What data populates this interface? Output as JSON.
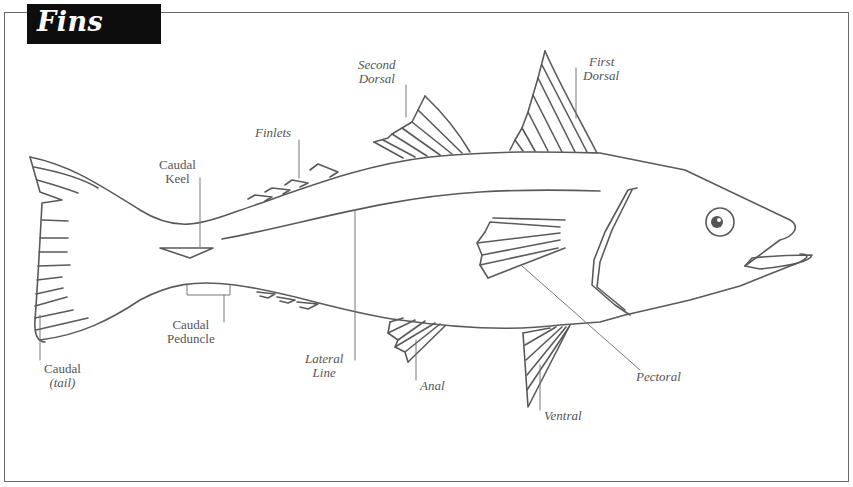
{
  "title": "Fins",
  "colors": {
    "title_bg": "#0d0d0d",
    "title_fg": "#ffffff",
    "line": "#5a5a5a",
    "label": "#555555"
  },
  "labels": {
    "second_dorsal": {
      "line1": "Second",
      "line2": "Dorsal"
    },
    "first_dorsal": {
      "line1": "First",
      "line2": "Dorsal"
    },
    "finlets": "Finlets",
    "caudal_keel": {
      "line1": "Caudal",
      "line2": "Keel"
    },
    "caudal_peduncle": {
      "line1": "Caudal",
      "line2": "Peduncle"
    },
    "caudal_tail": {
      "line1": "Caudal",
      "line2": "(tail)"
    },
    "lateral_line": {
      "line1": "Lateral",
      "line2": "Line"
    },
    "anal": "Anal",
    "ventral": "Ventral",
    "pectoral": "Pectoral"
  }
}
